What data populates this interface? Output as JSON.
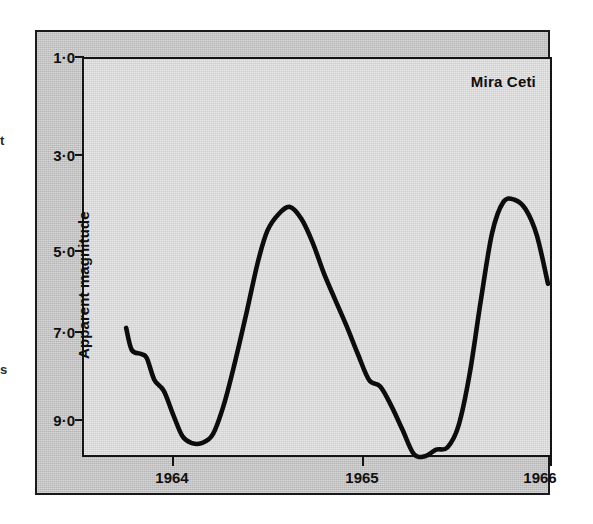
{
  "chart_data": {
    "type": "line",
    "title": "Mira Ceti",
    "xlabel": "",
    "ylabel": "Apparent magnitude",
    "grid": false,
    "legend": false,
    "y_inverted": true,
    "xlim": [
      1963.75,
      1966.05
    ],
    "ylim": [
      1.0,
      9.8
    ],
    "x_ticks": [
      "1964",
      "1965",
      "1966"
    ],
    "x_tick_values": [
      1964,
      1965,
      1966
    ],
    "y_ticks": [
      "1·0",
      "3·0",
      "5·0",
      "7·0",
      "9·0"
    ],
    "y_tick_values": [
      1.0,
      3.0,
      5.0,
      7.0,
      9.0
    ],
    "series": [
      {
        "name": "Mira Ceti",
        "x": [
          1963.75,
          1963.78,
          1963.83,
          1963.86,
          1963.9,
          1963.95,
          1964.0,
          1964.05,
          1964.1,
          1964.15,
          1964.21,
          1964.27,
          1964.33,
          1964.39,
          1964.45,
          1964.5,
          1964.56,
          1964.62,
          1964.68,
          1964.74,
          1964.8,
          1964.86,
          1964.92,
          1964.98,
          1965.04,
          1965.1,
          1965.16,
          1965.22,
          1965.28,
          1965.34,
          1965.4,
          1965.46,
          1965.52,
          1965.58,
          1965.64,
          1965.7,
          1965.76,
          1965.82,
          1965.88,
          1965.94,
          1966.0
        ],
        "y": [
          6.3,
          6.85,
          6.95,
          7.05,
          7.55,
          7.8,
          8.35,
          8.85,
          9.0,
          9.0,
          8.8,
          8.1,
          7.1,
          5.9,
          4.7,
          4.05,
          3.7,
          3.55,
          3.8,
          4.3,
          4.95,
          5.6,
          6.25,
          6.95,
          7.55,
          7.7,
          8.15,
          8.7,
          9.25,
          9.3,
          9.15,
          9.1,
          8.6,
          7.4,
          5.6,
          4.1,
          3.45,
          3.4,
          3.6,
          4.15,
          5.2
        ]
      }
    ],
    "annotations": [
      {
        "text": "Mira Ceti",
        "position": "top-right-inside-plot"
      }
    ]
  },
  "figure": {
    "series_title": "Mira Ceti",
    "y_axis_title": "Apparent magnitude"
  },
  "margin_fragments": [
    {
      "text": "t"
    },
    {
      "text": "s"
    }
  ]
}
